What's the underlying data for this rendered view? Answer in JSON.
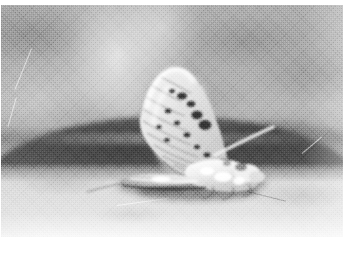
{
  "image": {
    "kind": "photograph",
    "medium": "black-and-white grainy print scan",
    "subject": "mayfly",
    "alt_text": "Grainy black-and-white photograph of a mayfly resting on a textured surface, its large mottled wing held upright and leaning to the right, with a dark rounded mound blurred in the background.",
    "caption": "",
    "width": 355,
    "height": 256
  },
  "frame": {
    "border_color": "#ffffff",
    "photo_left": 1,
    "photo_top": 5,
    "photo_width": 342,
    "photo_height": 232
  },
  "palette": {
    "paper_white": "#ffffff",
    "backdrop_gray": "#a9a9a9",
    "backdrop_light": "#b2b2b2",
    "mound_dark": "#4e4e4e",
    "mound_mid": "#676767",
    "foreground_light": "#dcdcdc",
    "foreground_bright": "#e6e6e6",
    "insect_highlight": "#f4f4f4",
    "insect_shadow": "#3a3a3a",
    "wing_spot": "#2e2e2e"
  },
  "scene": {
    "regions": [
      {
        "name": "upper-backdrop",
        "tone": "light mottled gray",
        "y_range": [
          0,
          56
        ]
      },
      {
        "name": "dark-mound",
        "tone": "dark gray arc",
        "y_range": [
          48,
          80
        ]
      },
      {
        "name": "foreground-surface",
        "tone": "bright grainy gray",
        "y_range": [
          66,
          100
        ]
      }
    ],
    "highlight": {
      "name": "soft-glow",
      "x_pct": 34,
      "y_pct": 22
    }
  },
  "insect": {
    "name": "mayfly",
    "pose": "resting, wing held upright and tilted right",
    "parts": [
      {
        "name": "forewing",
        "description": "large upright wing, pale with dark mottled spot rows along the veins"
      },
      {
        "name": "body",
        "description": "bright white thorax and head mass at the wing base"
      },
      {
        "name": "abdomen",
        "description": "slender segmented abdomen trailing to the lower left"
      },
      {
        "name": "cercus",
        "description": "thin pale filament angling up to the right"
      },
      {
        "name": "shadow",
        "description": "dark cast shadow beneath the body"
      }
    ],
    "wing": {
      "vein_count": 9,
      "spot_count": 14,
      "tip_x_pct": 40,
      "tip_y_pct": 33,
      "base_x_pct": 63,
      "base_y_pct": 72
    }
  },
  "fibres": [
    {
      "name": "fibre-left-upper",
      "left_pct": 4,
      "top_pct": 36,
      "length": 44,
      "angle_deg": 68,
      "tone": "light"
    },
    {
      "name": "fibre-left-lower",
      "left_pct": 2,
      "top_pct": 52,
      "length": 30,
      "angle_deg": 74,
      "tone": "light"
    },
    {
      "name": "fibre-bottom-mid",
      "left_pct": 34,
      "top_pct": 86,
      "length": 52,
      "angle_deg": 8,
      "tone": "light"
    },
    {
      "name": "fibre-bottom-right",
      "left_pct": 72,
      "top_pct": 80,
      "length": 40,
      "angle_deg": -14,
      "tone": "dark"
    },
    {
      "name": "fibre-right-edge",
      "left_pct": 88,
      "top_pct": 64,
      "length": 26,
      "angle_deg": 40,
      "tone": "light"
    }
  ]
}
